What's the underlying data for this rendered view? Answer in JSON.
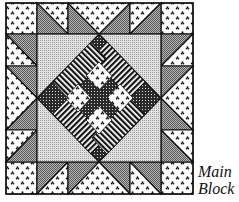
{
  "figure": {
    "caption_line1": "Main",
    "caption_line2": "Block"
  },
  "colors": {
    "outline": "#111111",
    "background": "#ffffff",
    "gray_dark": "#8a8a8a",
    "gray_light": "#c8c8c8",
    "stripe_dark": "#1a1a1a",
    "checker_dark": "#222222"
  },
  "grid": {
    "columns": [
      6,
      37,
      68,
      99,
      130,
      161,
      193
    ],
    "rows": [
      3,
      34,
      66,
      98,
      130,
      162,
      194
    ]
  }
}
